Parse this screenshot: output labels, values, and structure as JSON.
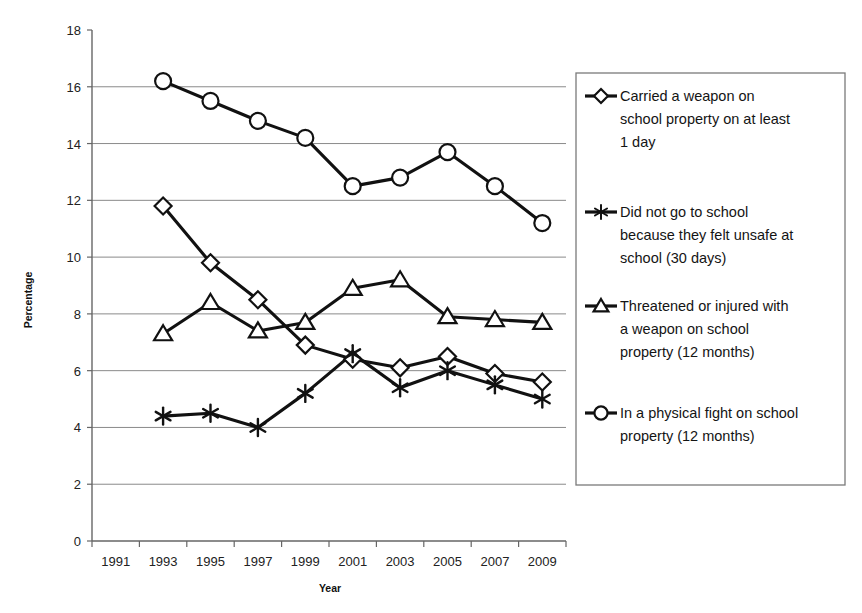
{
  "chart_data": {
    "type": "line",
    "title": "",
    "xlabel": "Year",
    "ylabel": "Percentage",
    "x": [
      "1991",
      "1993",
      "1995",
      "1997",
      "1999",
      "2001",
      "2003",
      "2005",
      "2007",
      "2009"
    ],
    "categories": [
      "1991",
      "1993",
      "1995",
      "1997",
      "1999",
      "2001",
      "2003",
      "2005",
      "2007",
      "2009"
    ],
    "xlim": [
      "1991",
      "2009"
    ],
    "ylim": [
      0,
      18
    ],
    "ytick_labels": [
      "18",
      "16",
      "14",
      "12",
      "10",
      "8",
      "6",
      "4",
      "2",
      "0"
    ],
    "yticks": [
      18,
      16,
      14,
      12,
      10,
      8,
      6,
      4,
      2,
      0
    ],
    "ytick_step": 2,
    "grid": "horizontal",
    "legend_position": "right",
    "series": [
      {
        "name": "Carried a weapon on school property on at least 1 day",
        "legend_label_lines": [
          "Carried a weapon on",
          "school property on at least",
          "1 day"
        ],
        "marker": "diamond",
        "color": "#111111",
        "x": [
          "1993",
          "1995",
          "1997",
          "1999",
          "2001",
          "2003",
          "2005",
          "2007",
          "2009"
        ],
        "values": [
          11.8,
          9.8,
          8.5,
          6.9,
          6.4,
          6.1,
          6.5,
          5.9,
          5.6
        ]
      },
      {
        "name": "Did not go to school because they felt unsafe at school (30 days)",
        "legend_label_lines": [
          "Did not go to school",
          "because they felt unsafe at",
          "school (30 days)"
        ],
        "marker": "asterisk",
        "color": "#111111",
        "x": [
          "1993",
          "1995",
          "1997",
          "1999",
          "2001",
          "2003",
          "2005",
          "2007",
          "2009"
        ],
        "values": [
          4.4,
          4.5,
          4.0,
          5.2,
          6.6,
          5.4,
          6.0,
          5.5,
          5.0
        ]
      },
      {
        "name": "Threatened or injured with a weapon on school property (12 months)",
        "legend_label_lines": [
          "Threatened or injured with",
          "a weapon on school",
          "property (12 months)"
        ],
        "marker": "triangle",
        "color": "#111111",
        "x": [
          "1993",
          "1995",
          "1997",
          "1999",
          "2001",
          "2003",
          "2005",
          "2007",
          "2009"
        ],
        "values": [
          7.3,
          8.4,
          7.4,
          7.7,
          8.9,
          9.2,
          7.9,
          7.8,
          7.7
        ]
      },
      {
        "name": "In a physical fight on school property (12 months)",
        "legend_label_lines": [
          "In a physical fight on school",
          "property (12 months)"
        ],
        "marker": "circle",
        "color": "#111111",
        "x": [
          "1993",
          "1995",
          "1997",
          "1999",
          "2001",
          "2003",
          "2005",
          "2007",
          "2009"
        ],
        "values": [
          16.2,
          15.5,
          14.8,
          14.2,
          12.5,
          12.8,
          13.7,
          12.5,
          11.2
        ]
      }
    ]
  }
}
